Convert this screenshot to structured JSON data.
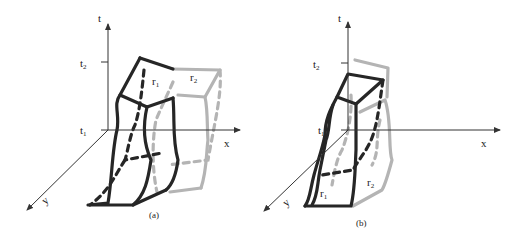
{
  "figure": {
    "panels": [
      {
        "id": "a",
        "caption": "(a)",
        "axes": {
          "t": "t",
          "x": "x",
          "y": "y"
        },
        "ticks": {
          "t2": {
            "base": "t",
            "sub": "2"
          },
          "t1": {
            "base": "t",
            "sub": "1"
          }
        },
        "regions": [
          {
            "label_base": "r",
            "label_sub": "1",
            "style": "dark"
          },
          {
            "label_base": "r",
            "label_sub": "2",
            "style": "light"
          }
        ],
        "extra_label": {
          "base": "r",
          "sub": "3"
        }
      },
      {
        "id": "b",
        "caption": "(b)",
        "axes": {
          "t": "t",
          "x": "x",
          "y": "y"
        },
        "ticks": {
          "t2": {
            "base": "t",
            "sub": "2"
          },
          "t1": {
            "base": "t",
            "sub": "1"
          }
        },
        "regions": [
          {
            "label_base": "r",
            "label_sub": "1",
            "style": "dark"
          },
          {
            "label_base": "r",
            "label_sub": "2",
            "style": "light"
          }
        ]
      }
    ],
    "colors": {
      "dark_region": "#262626",
      "light_region": "#b4b4b4",
      "axis": "#333333"
    }
  }
}
